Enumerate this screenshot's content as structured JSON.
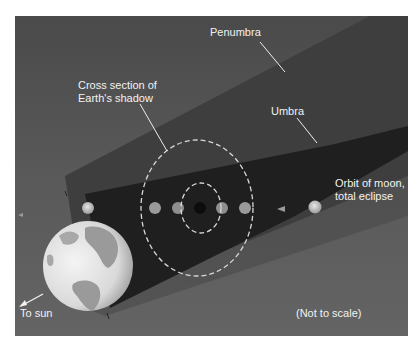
{
  "diagram": {
    "labels": {
      "penumbra": "Penumbra",
      "umbra": "Umbra",
      "cross_section": "Cross section of\nEarth's shadow",
      "orbit": "Orbit of moon,\ntotal eclipse",
      "to_sun": "To sun",
      "not_to_scale": "(Not to scale)"
    },
    "colors": {
      "background": "#5a5a5a",
      "penumbra": "#3f3f3f",
      "umbra": "#1e1e1e",
      "label_text": "#f2f2f2",
      "dashed_line": "#d8d8d8",
      "moon": "#c8c8c8",
      "earth_land": "#9a9a9a",
      "earth_ocean": "#e6e6e6"
    },
    "elements": [
      "earth",
      "penumbra-cone",
      "umbra-cone",
      "outer-shadow-cross-section",
      "inner-shadow-cross-section",
      "moon-positions"
    ],
    "moon_positions_count": 8
  }
}
